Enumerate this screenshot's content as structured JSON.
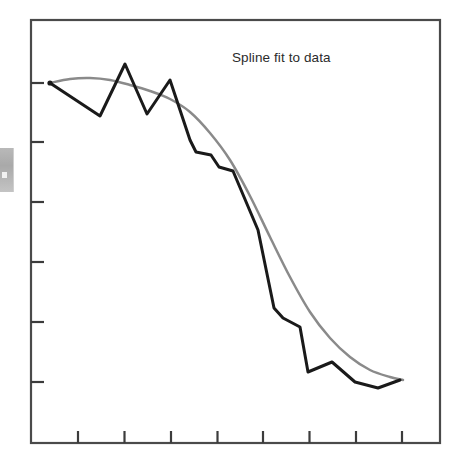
{
  "figure": {
    "title": "Spline fit to data",
    "background_color": "#ffffff",
    "frame_color": "#4a4a4a",
    "data_line_color": "#1a1a1a",
    "spline_line_color": "#8a8a8a",
    "artifact_label": "scan-edge-artifact"
  },
  "chart_data": {
    "type": "line",
    "title": "Spline fit to data",
    "xlabel": "",
    "ylabel": "",
    "xlim": [
      0,
      10
    ],
    "ylim": [
      0,
      10
    ],
    "grid": false,
    "legend_position": "none",
    "axis": {
      "x_ticks": [
        1,
        2,
        3,
        4,
        5,
        6,
        7,
        8
      ],
      "x_tick_labels": [
        "",
        "",
        "",
        "",
        "",
        "",
        "",
        ""
      ],
      "y_ticks": [
        1,
        2,
        3,
        4,
        5,
        6
      ],
      "y_tick_labels": [
        "",
        "",
        "",
        "",
        "",
        ""
      ],
      "x_tick_pixels": [
        78,
        124.5,
        171,
        217.5,
        263,
        309.5,
        356,
        402
      ],
      "y_tick_pixels": [
        83,
        142,
        202,
        262,
        322,
        382
      ],
      "frame_pixels": {
        "left": 31,
        "right": 440,
        "top": 20,
        "bottom": 443
      }
    },
    "series": [
      {
        "name": "data",
        "style": "polyline",
        "color": "#1a1a1a",
        "width": 3,
        "points_pixels": [
          [
            50,
            83
          ],
          [
            100,
            116
          ],
          [
            125,
            64
          ],
          [
            147,
            114
          ],
          [
            170,
            80
          ],
          [
            190,
            140
          ],
          [
            196,
            152
          ],
          [
            211,
            155
          ],
          [
            219,
            167
          ],
          [
            233,
            171
          ],
          [
            258,
            230
          ],
          [
            274,
            308
          ],
          [
            283,
            318
          ],
          [
            300,
            327
          ],
          [
            308,
            372
          ],
          [
            332,
            362
          ],
          [
            355,
            382
          ],
          [
            378,
            388
          ],
          [
            400,
            380
          ]
        ],
        "points_data": [
          [
            0.47,
            8.59
          ],
          [
            1.54,
            7.81
          ],
          [
            2.08,
            9.04
          ],
          [
            2.55,
            7.85
          ],
          [
            3.04,
            8.66
          ],
          [
            3.47,
            7.24
          ],
          [
            3.6,
            6.95
          ],
          [
            3.92,
            6.88
          ],
          [
            4.09,
            6.6
          ],
          [
            4.39,
            6.5
          ],
          [
            4.92,
            5.1
          ],
          [
            5.27,
            3.26
          ],
          [
            5.46,
            3.02
          ],
          [
            5.82,
            2.81
          ],
          [
            5.99,
            1.74
          ],
          [
            6.51,
            1.98
          ],
          [
            7.0,
            1.51
          ],
          [
            7.49,
            1.37
          ],
          [
            7.96,
            1.56
          ]
        ]
      },
      {
        "name": "spline fit",
        "style": "smooth",
        "color": "#8a8a8a",
        "width": 2.5,
        "points_pixels": [
          [
            50,
            83
          ],
          [
            70,
            79
          ],
          [
            90,
            78
          ],
          [
            110,
            80
          ],
          [
            130,
            85
          ],
          [
            150,
            91
          ],
          [
            170,
            99
          ],
          [
            190,
            112
          ],
          [
            210,
            133
          ],
          [
            230,
            160
          ],
          [
            250,
            196
          ],
          [
            270,
            237
          ],
          [
            290,
            277
          ],
          [
            310,
            312
          ],
          [
            330,
            338
          ],
          [
            350,
            357
          ],
          [
            370,
            370
          ],
          [
            390,
            377
          ],
          [
            403,
            380
          ]
        ]
      }
    ]
  }
}
